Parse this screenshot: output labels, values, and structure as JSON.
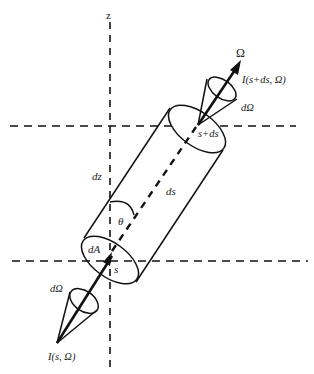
{
  "figure": {
    "type": "radiative-transfer-cylinder",
    "axis_label": "z",
    "direction_label": "Ω",
    "labels": {
      "intensity_top": "I(s+ds, Ω)",
      "solid_angle_top": "dΩ",
      "position_top": "s+ds",
      "path_element": "ds",
      "vertical_element": "dz",
      "angle": "θ",
      "area": "dA",
      "position_bottom": "s",
      "solid_angle_bottom": "dΩ",
      "intensity_bottom": "I(s, Ω)"
    },
    "colors": {
      "stroke": "#111111",
      "background": "#ffffff"
    }
  }
}
